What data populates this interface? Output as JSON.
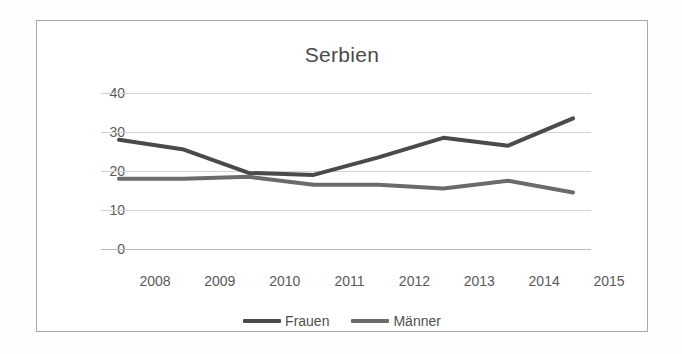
{
  "chart_data": {
    "type": "line",
    "title": "Serbien",
    "xlabel": "",
    "ylabel": "",
    "categories": [
      "2008",
      "2009",
      "2010",
      "2011",
      "2012",
      "2013",
      "2014",
      "2015"
    ],
    "x": [
      2008,
      2009,
      2010,
      2011,
      2012,
      2013,
      2014,
      2015
    ],
    "ylim": [
      0,
      40
    ],
    "yticks": [
      0,
      10,
      20,
      30,
      40
    ],
    "ytick_labels": [
      "0",
      "10",
      "20",
      "30",
      "40"
    ],
    "grid": true,
    "legend_position": "bottom",
    "series": [
      {
        "name": "Frauen",
        "color": "#4a4a4a",
        "values": [
          28,
          25.5,
          19.5,
          19,
          23.5,
          28.5,
          26.5,
          33.5
        ]
      },
      {
        "name": "Männer",
        "color": "#6b6b6b",
        "values": [
          18,
          18,
          18.5,
          16.5,
          16.5,
          15.5,
          17.5,
          14.5
        ]
      }
    ]
  },
  "legend": {
    "items": [
      {
        "label": "Frauen"
      },
      {
        "label": "Männer"
      }
    ]
  },
  "colors": {
    "frame_border": "#a8a8a8",
    "gridline": "#d2d2d2",
    "text": "#595959",
    "series_frauen": "#4a4a4a",
    "series_maenner": "#6b6b6b"
  }
}
